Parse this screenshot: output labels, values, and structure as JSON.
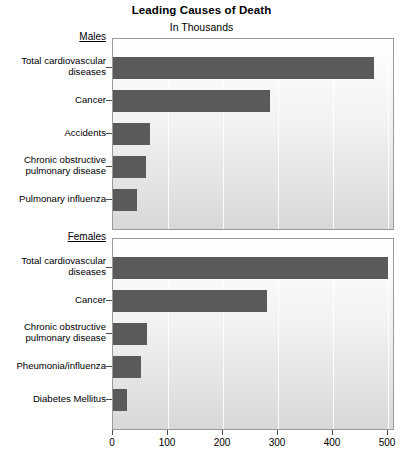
{
  "chart_data": {
    "type": "bar",
    "orientation": "horizontal",
    "title": "Leading Causes of Death",
    "subtitle": "In Thousands",
    "xlabel": "",
    "ylabel": "",
    "xlim": [
      0,
      500
    ],
    "xticks": [
      0,
      100,
      200,
      300,
      400,
      500
    ],
    "xticklabels": [
      "0",
      "100",
      "200",
      "300",
      "400",
      "500"
    ],
    "grid": true,
    "legend": "none",
    "panels": [
      {
        "name": "Males",
        "label": "Males",
        "categories": [
          "Total cardiovascular\ndiseases",
          "Cancer",
          "Accidents",
          "Chronic obstructive\npulmonary disease",
          "Pulmonary influenza"
        ],
        "values": [
          475,
          285,
          68,
          60,
          44
        ]
      },
      {
        "name": "Females",
        "label": "Females",
        "categories": [
          "Total cardiovascular\ndiseases",
          "Cancer",
          "Chronic obstructive\npulmonary disease",
          "Pheumonia/influenza",
          "Diabetes Mellitus"
        ],
        "values": [
          500,
          280,
          62,
          50,
          25
        ]
      }
    ],
    "colors": {
      "bar": "#5a5a5a",
      "panel_border": "#9a9a9a",
      "gridline": "#ffffff",
      "text": "#000000",
      "background": "#ffffff"
    }
  }
}
